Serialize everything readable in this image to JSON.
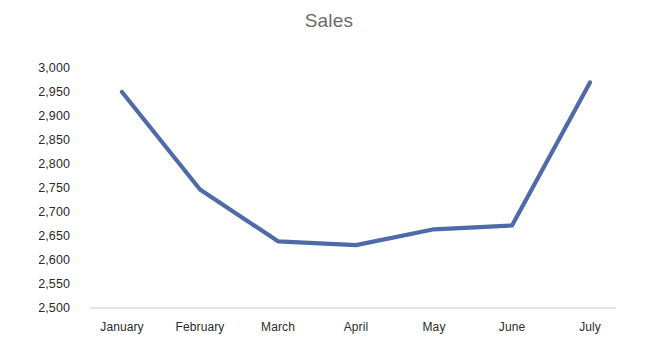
{
  "chart_data": {
    "type": "line",
    "title": "Sales",
    "xlabel": "",
    "ylabel": "",
    "categories": [
      "January",
      "February",
      "March",
      "April",
      "May",
      "June",
      "July"
    ],
    "series": [
      {
        "name": "Sales",
        "values": [
          2950,
          2747,
          2639,
          2631,
          2664,
          2672,
          2970
        ],
        "color": "#4E6AA8"
      }
    ],
    "ylim": [
      2500,
      3000
    ],
    "ytick_step": 50,
    "ytick_labels": [
      "3,000",
      "2,950",
      "2,900",
      "2,850",
      "2,800",
      "2,750",
      "2,700",
      "2,650",
      "2,600",
      "2,550",
      "2,500"
    ],
    "ytick_values": [
      3000,
      2950,
      2900,
      2850,
      2800,
      2750,
      2700,
      2650,
      2600,
      2550,
      2500
    ],
    "grid": false,
    "legend": "none",
    "axis_line_color": "#e6e4e0",
    "title_color": "#6b6b6b",
    "tick_label_color": "#2b2b2b"
  },
  "axis": {
    "baseline_label": "2,500",
    "top_label": "3,000"
  }
}
